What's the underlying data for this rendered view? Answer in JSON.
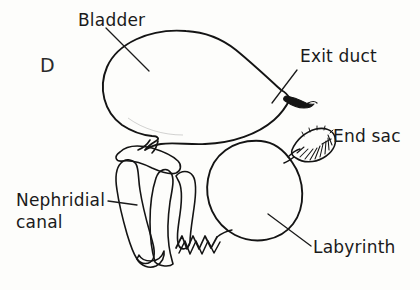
{
  "figure": {
    "panel_letter": "D",
    "background_color": "#fdfdfb",
    "ink_color": "#141414",
    "description_kind": "hand-drawn anatomical line diagram of a crustacean nephridium (antennal gland)"
  },
  "labels": {
    "bladder": "Bladder",
    "exit_duct": "Exit duct",
    "end_sac": "End sac",
    "nephridial_canal_line1": "Nephridial",
    "nephridial_canal_line2": "canal",
    "labyrinth": "Labyrinth"
  },
  "structures": [
    {
      "name": "bladder",
      "label": "Bladder",
      "texture": "fine stipple",
      "fill": "#ffffff"
    },
    {
      "name": "exit-duct",
      "label": "Exit duct",
      "texture": "solid dark tip",
      "fill": "#141414"
    },
    {
      "name": "nephridial-canal",
      "label": "Nephridial canal",
      "texture": "coarse mottled tube",
      "fill": "#ffffff"
    },
    {
      "name": "labyrinth",
      "label": "Labyrinth",
      "texture": "dense maze mottling",
      "fill": "#ffffff"
    },
    {
      "name": "end-sac",
      "label": "End sac",
      "texture": "radiating striations",
      "fill": "#ffffff"
    }
  ]
}
